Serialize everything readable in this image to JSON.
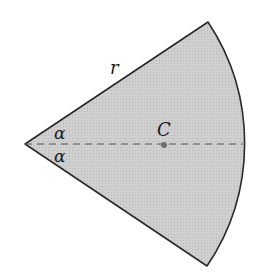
{
  "figure": {
    "type": "circular-sector",
    "fill_color": "#c8c8c8",
    "stroke_color": "#2a2a2a",
    "labels": {
      "radius": "r",
      "half_angle_top": "α",
      "half_angle_bottom": "α",
      "centroid": "C"
    },
    "geometry": {
      "apex": [
        25,
        144
      ],
      "radius_px": 219,
      "top_corner": [
        208,
        22
      ],
      "bottom_corner": [
        207,
        266
      ],
      "centroid_point": [
        164,
        145
      ]
    }
  }
}
